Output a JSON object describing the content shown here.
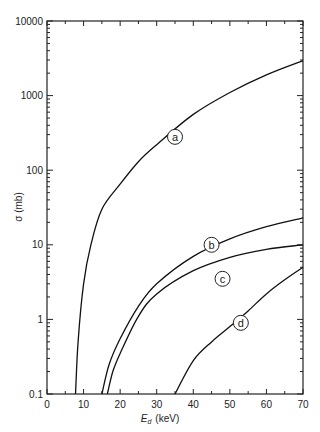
{
  "chart_data": {
    "type": "line",
    "title": "",
    "xlabel": "E_d (keV)",
    "ylabel": "σ (mb)",
    "xscale": "linear",
    "yscale": "log",
    "xlim": [
      0,
      70
    ],
    "ylim": [
      0.1,
      10000
    ],
    "x_ticks": [
      0,
      10,
      20,
      30,
      40,
      50,
      60,
      70
    ],
    "x_tick_labels": [
      "0",
      "10",
      "20",
      "30",
      "40",
      "50",
      "60",
      "70"
    ],
    "y_ticks": [
      0.1,
      1,
      10,
      100,
      1000,
      10000
    ],
    "y_tick_labels": [
      "0.1",
      "1",
      "10",
      "100",
      "1000",
      "10000"
    ],
    "grid": false,
    "legend": "none (curves labeled inline with circled letters)",
    "series": [
      {
        "name": "a",
        "label_pos": [
          35,
          280
        ],
        "x": [
          7.8,
          8.5,
          10,
          12,
          15,
          20,
          25,
          30,
          40,
          50,
          60,
          70
        ],
        "y": [
          0.1,
          0.5,
          3,
          10,
          30,
          65,
          130,
          220,
          560,
          1100,
          1900,
          2950
        ]
      },
      {
        "name": "b",
        "label_pos": [
          45,
          10
        ],
        "x": [
          15,
          17,
          20,
          25,
          30,
          40,
          50,
          60,
          70
        ],
        "y": [
          0.1,
          0.25,
          0.55,
          1.5,
          3.0,
          7,
          12,
          17.5,
          23
        ]
      },
      {
        "name": "c",
        "label_pos": [
          48,
          3.5
        ],
        "x": [
          16.5,
          18,
          20,
          25,
          30,
          40,
          50,
          60,
          70
        ],
        "y": [
          0.1,
          0.2,
          0.35,
          1.1,
          2.2,
          4.5,
          6.8,
          8.7,
          10
        ]
      },
      {
        "name": "d",
        "label_pos": [
          53,
          0.9
        ],
        "x": [
          35,
          40,
          45,
          50,
          55,
          60,
          65,
          70
        ],
        "y": [
          0.1,
          0.28,
          0.5,
          0.8,
          1.3,
          2.2,
          3.4,
          5
        ]
      }
    ]
  },
  "labels": {
    "xlabel_main": "E",
    "xlabel_sub": "d",
    "xlabel_unit": "(keV)",
    "ylabel": "σ  (mb)"
  }
}
